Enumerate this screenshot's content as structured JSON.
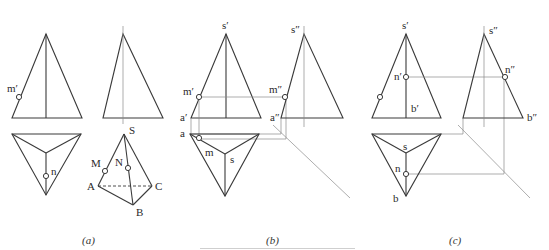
{
  "figure": {
    "panels": [
      {
        "id": "a",
        "caption": "(a)",
        "front_view_labels": {
          "point": "m′"
        },
        "top_view_labels": {
          "point": "n"
        },
        "pictorial_labels": {
          "apex": "S",
          "a": "A",
          "b": "B",
          "c": "C",
          "m": "M",
          "n": "N"
        }
      },
      {
        "id": "b",
        "caption": "(b)",
        "front_view_labels": {
          "apex": "s′",
          "point": "m′",
          "base_left": "a′"
        },
        "side_view_labels": {
          "apex": "s″",
          "point": "m″",
          "base_left": "a″"
        },
        "top_view_labels": {
          "corner": "a",
          "point": "m",
          "center": "s"
        }
      },
      {
        "id": "c",
        "caption": "(c)",
        "front_view_labels": {
          "apex": "s′",
          "point": "n′",
          "base_mid": "b′"
        },
        "side_view_labels": {
          "apex": "s″",
          "point": "n″",
          "base_right": "b″"
        },
        "top_view_labels": {
          "center": "s",
          "point": "n",
          "corner": "b"
        }
      }
    ],
    "line_color": "#3a3a3a",
    "construction_line_color": "#8a8a8a"
  }
}
